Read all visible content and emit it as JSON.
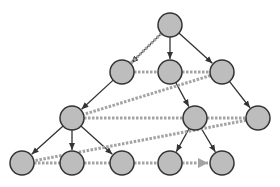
{
  "diagram": {
    "type": "tree-bfs-traversal",
    "colors": {
      "background": "#ffffff",
      "node_fill": "#bdbdbd",
      "node_stroke": "#333333",
      "tree_edge": "#333333",
      "traversal_edge": "#a3a3a3"
    },
    "node_radius": 12,
    "nodes": [
      {
        "id": "n0",
        "level": 0,
        "x": 170,
        "y": 25
      },
      {
        "id": "n1",
        "level": 1,
        "x": 122,
        "y": 72
      },
      {
        "id": "n2",
        "level": 1,
        "x": 170,
        "y": 72
      },
      {
        "id": "n3",
        "level": 1,
        "x": 222,
        "y": 72
      },
      {
        "id": "n4",
        "level": 2,
        "x": 72,
        "y": 118
      },
      {
        "id": "n5",
        "level": 2,
        "x": 195,
        "y": 118
      },
      {
        "id": "n6",
        "level": 2,
        "x": 258,
        "y": 118
      },
      {
        "id": "n7",
        "level": 3,
        "x": 22,
        "y": 163
      },
      {
        "id": "n8",
        "level": 3,
        "x": 72,
        "y": 163
      },
      {
        "id": "n9",
        "level": 3,
        "x": 122,
        "y": 163
      },
      {
        "id": "n10",
        "level": 3,
        "x": 170,
        "y": 163
      },
      {
        "id": "n11",
        "level": 3,
        "x": 222,
        "y": 163
      }
    ],
    "tree_edges": [
      [
        "n0",
        "n1"
      ],
      [
        "n0",
        "n2"
      ],
      [
        "n0",
        "n3"
      ],
      [
        "n1",
        "n4"
      ],
      [
        "n2",
        "n5"
      ],
      [
        "n3",
        "n6"
      ],
      [
        "n4",
        "n7"
      ],
      [
        "n4",
        "n8"
      ],
      [
        "n4",
        "n9"
      ],
      [
        "n5",
        "n10"
      ],
      [
        "n5",
        "n11"
      ]
    ],
    "traversal_order": [
      "n0",
      "n1",
      "n2",
      "n3",
      "n4",
      "n5",
      "n6",
      "n7",
      "n8",
      "n9",
      "n10",
      "n11"
    ]
  }
}
